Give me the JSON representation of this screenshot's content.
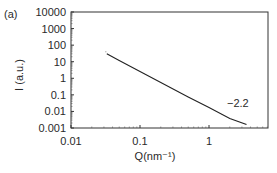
{
  "panel_label": "(a)",
  "chart_data": {
    "type": "line",
    "title": "",
    "panel": "(a)",
    "xlabel": "Q(nm⁻¹)",
    "ylabel": "I (a.u.)",
    "xscale": "log",
    "yscale": "log",
    "xlim": [
      0.01,
      7
    ],
    "ylim": [
      0.001,
      10000
    ],
    "x_ticks": [
      {
        "value": 0.01,
        "label": "0.01"
      },
      {
        "value": 0.1,
        "label": "0.1"
      },
      {
        "value": 1,
        "label": "1"
      }
    ],
    "y_ticks": [
      {
        "value": 10000,
        "label": "10000"
      },
      {
        "value": 1000,
        "label": "1000"
      },
      {
        "value": 100,
        "label": "100"
      },
      {
        "value": 10,
        "label": "10"
      },
      {
        "value": 1,
        "label": "1"
      },
      {
        "value": 0.1,
        "label": "0.1"
      },
      {
        "value": 0.01,
        "label": "0.01"
      },
      {
        "value": 0.001,
        "label": "0.001"
      }
    ],
    "grid": false,
    "legend": null,
    "series": [
      {
        "name": "data",
        "x": [
          0.033,
          0.05,
          0.1,
          0.2,
          0.5,
          1.0,
          2.0,
          3.5
        ],
        "y": [
          30,
          12,
          2.6,
          0.55,
          0.075,
          0.017,
          0.0038,
          0.0016
        ]
      }
    ],
    "annotations": [
      {
        "text": "−2.2",
        "x": 1.6,
        "y": 0.02,
        "meaning": "power-law slope"
      }
    ]
  }
}
